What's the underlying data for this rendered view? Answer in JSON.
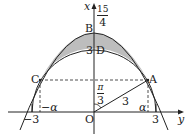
{
  "diagram": {
    "axes": {
      "vertical_axis_label": "x",
      "horizontal_axis_label": "y",
      "origin_label": "O"
    },
    "points": {
      "A": "A",
      "B": "B",
      "C": "C",
      "D": "D"
    },
    "labels": {
      "B_value_numerator": "15",
      "B_value_denominator": "4",
      "D_value": "3",
      "angle_numerator": "π",
      "angle_denominator": "3",
      "radius": "3",
      "alpha": "α",
      "neg_alpha": "−α",
      "tick_pos_3": "3",
      "tick_neg_3": "−3"
    },
    "colors": {
      "shaded_region": "#bdbdbd",
      "stroke": "#222222"
    }
  }
}
